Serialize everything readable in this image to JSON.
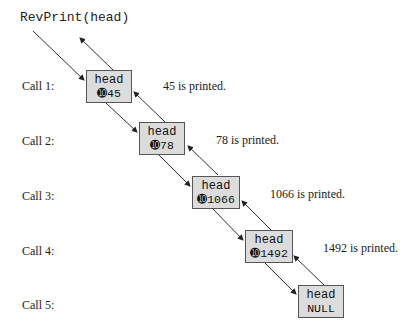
{
  "title": "RevPrint(head)",
  "calls": [
    {
      "label": "Call 1:",
      "head_label": "head",
      "value": "➓45",
      "printed": "45 is printed."
    },
    {
      "label": "Call 2:",
      "head_label": "head",
      "value": "➓78",
      "printed": "78 is printed."
    },
    {
      "label": "Call 3:",
      "head_label": "head",
      "value": "➓1066",
      "printed": "1066 is printed."
    },
    {
      "label": "Call 4:",
      "head_label": "head",
      "value": "➓1492",
      "printed": "1492 is printed."
    },
    {
      "label": "Call 5:",
      "head_label": "head",
      "value": "NULL",
      "printed": ""
    }
  ],
  "colors": {
    "box_fill": "#dcdcdc",
    "box_border": "#555555",
    "line": "#333333"
  }
}
